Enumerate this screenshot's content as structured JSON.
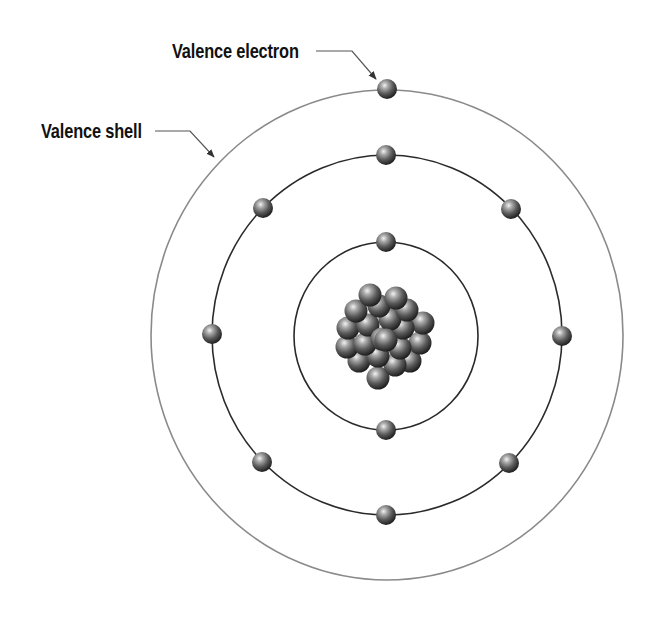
{
  "diagram": {
    "type": "bohr-atom-model",
    "labels": {
      "valence_electron": "Valence electron",
      "valence_shell": "Valence shell"
    },
    "colors": {
      "background": "#ffffff",
      "label_text": "#111111",
      "outer_shell_stroke": "#8a8a8a",
      "inner_shell_stroke": "#2a2a2a",
      "leader_line": "#555555",
      "sphere_highlight": "#e8e8e8",
      "sphere_mid": "#6e6e6e",
      "sphere_dark": "#1e1e1e"
    },
    "shells": [
      {
        "name": "shell-1",
        "electron_count": 2
      },
      {
        "name": "shell-2",
        "electron_count": 8
      },
      {
        "name": "shell-3-valence",
        "electron_count": 1
      }
    ],
    "nucleus": {
      "particle_count": 21
    }
  }
}
